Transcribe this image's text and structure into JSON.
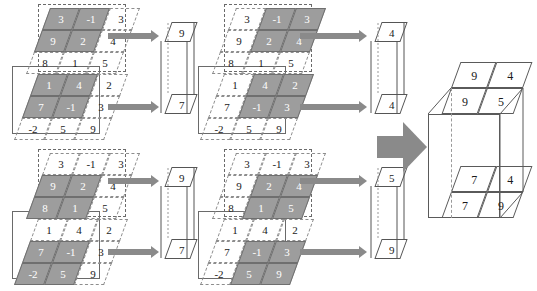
{
  "figure": {
    "colors": {
      "highlight_fill": "#9d9d9d",
      "arrow": "#8a8a8a",
      "grid_line": "#8d8d8d",
      "box_line": "#5a5a5a",
      "background": "#ffffff"
    }
  },
  "stages": [
    {
      "id": "stage-1",
      "name": "top-row-input",
      "front_matrix": {
        "name": "front-feature-map",
        "rows": [
          [
            "3",
            "-1",
            "3"
          ],
          [
            "9",
            "2",
            "4"
          ],
          [
            "8",
            "1",
            "5"
          ]
        ],
        "window": {
          "row": 0,
          "col": 0,
          "size": 2,
          "cells": [
            "3",
            "-1",
            "9",
            "2"
          ],
          "max": "9"
        }
      },
      "back_matrix": {
        "name": "back-feature-map",
        "rows": [
          [
            "1",
            "4",
            "2"
          ],
          [
            "7",
            "-1",
            "3"
          ],
          [
            "-2",
            "5",
            "9"
          ]
        ],
        "window": {
          "row": 0,
          "col": 0,
          "size": 2,
          "cells": [
            "1",
            "4",
            "7",
            "-1"
          ],
          "max": "7"
        }
      },
      "output": {
        "name": "pool-output-1",
        "top": "9",
        "bottom": "7"
      }
    },
    {
      "id": "stage-2",
      "name": "top-row-shift-right",
      "front_matrix": {
        "name": "front-feature-map",
        "rows": [
          [
            "3",
            "-1",
            "3"
          ],
          [
            "9",
            "2",
            "4"
          ],
          [
            "8",
            "1",
            "5"
          ]
        ],
        "window": {
          "row": 0,
          "col": 1,
          "size": 2,
          "cells": [
            "-1",
            "3",
            "2",
            "4"
          ],
          "max": "4"
        }
      },
      "back_matrix": {
        "name": "back-feature-map",
        "rows": [
          [
            "1",
            "4",
            "2"
          ],
          [
            "7",
            "-1",
            "3"
          ],
          [
            "-2",
            "5",
            "9"
          ]
        ],
        "window": {
          "row": 0,
          "col": 1,
          "size": 2,
          "cells": [
            "4",
            "2",
            "-1",
            "3"
          ],
          "max": "4"
        }
      },
      "output": {
        "name": "pool-output-2",
        "top": "4",
        "bottom": "4"
      }
    },
    {
      "id": "stage-3",
      "name": "bottom-row-input",
      "front_matrix": {
        "name": "front-feature-map",
        "rows": [
          [
            "3",
            "-1",
            "3"
          ],
          [
            "9",
            "2",
            "4"
          ],
          [
            "8",
            "1",
            "5"
          ]
        ],
        "window": {
          "row": 1,
          "col": 0,
          "size": 2,
          "cells": [
            "9",
            "2",
            "8",
            "1"
          ],
          "max": "9"
        }
      },
      "back_matrix": {
        "name": "back-feature-map",
        "rows": [
          [
            "1",
            "4",
            "2"
          ],
          [
            "7",
            "-1",
            "3"
          ],
          [
            "-2",
            "5",
            "9"
          ]
        ],
        "window": {
          "row": 1,
          "col": 0,
          "size": 2,
          "cells": [
            "7",
            "-1",
            "-2",
            "5"
          ],
          "max": "7"
        }
      },
      "output": {
        "name": "pool-output-3",
        "top": "9",
        "bottom": "7"
      }
    },
    {
      "id": "stage-4",
      "name": "bottom-row-shift-right",
      "front_matrix": {
        "name": "front-feature-map",
        "rows": [
          [
            "3",
            "-1",
            "3"
          ],
          [
            "9",
            "2",
            "4"
          ],
          [
            "8",
            "1",
            "5"
          ]
        ],
        "window": {
          "row": 1,
          "col": 1,
          "size": 2,
          "cells": [
            "2",
            "4",
            "1",
            "5"
          ],
          "max": "5"
        }
      },
      "back_matrix": {
        "name": "back-feature-map",
        "rows": [
          [
            "1",
            "4",
            "2"
          ],
          [
            "7",
            "-1",
            "3"
          ],
          [
            "-2",
            "5",
            "9"
          ]
        ],
        "window": {
          "row": 1,
          "col": 1,
          "size": 2,
          "cells": [
            "-1",
            "3",
            "5",
            "9"
          ],
          "max": "9"
        }
      },
      "output": {
        "name": "pool-output-4",
        "top": "5",
        "bottom": "9"
      }
    }
  ],
  "result": {
    "name": "final-pooled-volume",
    "front_layer": [
      [
        "9",
        "4"
      ],
      [
        "9",
        "5"
      ]
    ],
    "back_layer": [
      [
        "7",
        "4"
      ],
      [
        "7",
        "9"
      ]
    ]
  },
  "chart_data": {
    "type": "diagram",
    "input_front": [
      [
        "3",
        "-1",
        "3"
      ],
      [
        "9",
        "2",
        "4"
      ],
      [
        "8",
        "1",
        "5"
      ]
    ],
    "input_back": [
      [
        "1",
        "4",
        "2"
      ],
      [
        "7",
        "-1",
        "3"
      ],
      [
        "-2",
        "5",
        "9"
      ]
    ],
    "pool_size": 2,
    "stride": 1,
    "output_front": [
      [
        "9",
        "4"
      ],
      [
        "9",
        "5"
      ]
    ],
    "output_back": [
      [
        "7",
        "4"
      ],
      [
        "7",
        "9"
      ]
    ]
  }
}
